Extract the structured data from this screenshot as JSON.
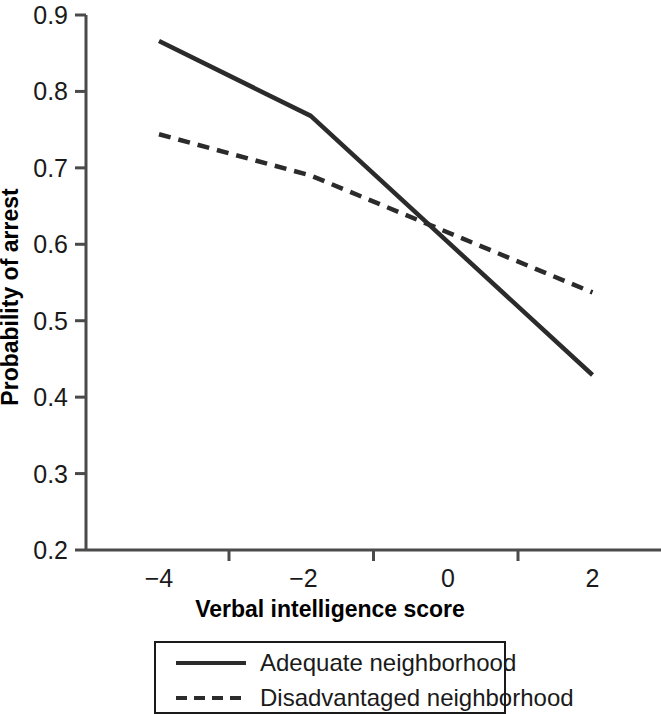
{
  "chart_data": {
    "type": "line",
    "title": "",
    "subtitle": "",
    "xlabel": "Verbal intelligence score",
    "ylabel": "Probability of arrest",
    "xlim": [
      -5.0,
      2.6
    ],
    "ylim": [
      0.2,
      0.9
    ],
    "xticks": [
      -4,
      -2,
      0,
      2
    ],
    "xtick_labels": [
      "−4",
      "−2",
      "0",
      "2"
    ],
    "yticks": [
      0.2,
      0.3,
      0.4,
      0.5,
      0.6,
      0.7,
      0.8,
      0.9
    ],
    "ytick_labels": [
      "0.2",
      "0.3",
      "0.4",
      "0.5",
      "0.6",
      "0.7",
      "0.8",
      "0.9"
    ],
    "grid": false,
    "legend_position": "below-axes",
    "series": [
      {
        "name": "Adequate neighborhood",
        "style": "solid",
        "color": "#2b2b2b",
        "x": [
          -4.0,
          -1.9,
          2.0
        ],
        "values": [
          0.866,
          0.768,
          0.429
        ]
      },
      {
        "name": "Disadvantaged neighborhood",
        "style": "dashed",
        "color": "#2b2b2b",
        "x": [
          -4.0,
          -1.9,
          2.0
        ],
        "values": [
          0.744,
          0.69,
          0.537
        ]
      }
    ],
    "annotations": []
  },
  "axes": {
    "y_title": "Probability of arrest",
    "x_title": "Verbal intelligence score"
  },
  "legend": {
    "entries": [
      {
        "label": "Adequate neighborhood",
        "style": "solid"
      },
      {
        "label": "Disadvantaged neighborhood",
        "style": "dashed"
      }
    ]
  },
  "colors": {
    "line": "#2b2b2b",
    "axis": "#4a4a4a",
    "text": "#1a1a1a",
    "background": "#ffffff"
  }
}
